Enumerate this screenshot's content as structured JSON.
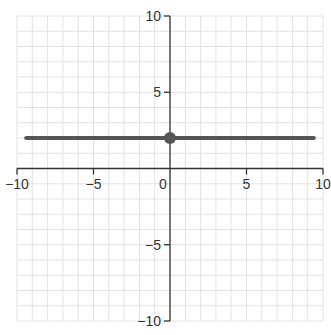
{
  "chart_data": {
    "type": "line",
    "title": "",
    "xlabel": "",
    "ylabel": "",
    "xlim": [
      -10,
      10
    ],
    "ylim": [
      -10,
      10
    ],
    "grid": true,
    "grid_step": 1,
    "x_ticks": [
      -10,
      -5,
      0,
      5,
      10
    ],
    "y_ticks": [
      -10,
      -5,
      5,
      10
    ],
    "x_tick_labels": [
      "−10",
      "−5",
      "0",
      "5",
      "10"
    ],
    "y_tick_labels": [
      "−10",
      "−5",
      "5",
      "10"
    ],
    "series": [
      {
        "name": "y = 2",
        "kind": "horizontal-line",
        "x": [
          -9.4,
          9.4
        ],
        "y": [
          2,
          2
        ],
        "color": "#555555"
      }
    ],
    "points": [
      {
        "x": 0,
        "y": 2,
        "color": "#555555"
      }
    ]
  },
  "style": {
    "grid_color": "#e2e2e2",
    "axis_color": "#333333",
    "line_color": "#555555",
    "point_color": "#555555"
  }
}
